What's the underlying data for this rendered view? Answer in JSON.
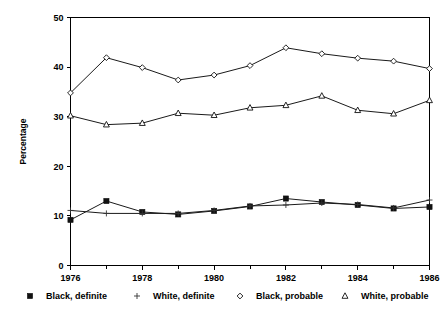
{
  "chart_data": {
    "type": "line",
    "title": "",
    "xlabel": "",
    "ylabel": "Percentage",
    "x": [
      1976,
      1977,
      1978,
      1979,
      1980,
      1981,
      1982,
      1983,
      1984,
      1985,
      1986
    ],
    "xlim": [
      1976,
      1986
    ],
    "ylim": [
      0,
      50
    ],
    "x_tick_labels": [
      "1976",
      "1978",
      "1980",
      "1982",
      "1984",
      "1986"
    ],
    "x_tick_values": [
      1976,
      1978,
      1980,
      1982,
      1984,
      1986
    ],
    "x_minor_tick_values": [
      1977,
      1979,
      1981,
      1983,
      1985
    ],
    "y_tick_labels": [
      "0",
      "10",
      "20",
      "30",
      "40",
      "50"
    ],
    "y_tick_values": [
      0,
      10,
      20,
      30,
      40,
      50
    ],
    "grid": false,
    "legend_position": "bottom",
    "series": [
      {
        "name": "Black, definite",
        "marker": "filled-square",
        "values": [
          9.2,
          13.0,
          10.8,
          10.3,
          11.0,
          11.9,
          13.5,
          12.8,
          12.2,
          11.5,
          11.8
        ]
      },
      {
        "name": "White, definite",
        "marker": "plus",
        "values": [
          11.1,
          10.5,
          10.5,
          10.5,
          11.1,
          12.0,
          12.2,
          12.6,
          12.3,
          11.6,
          13.2
        ]
      },
      {
        "name": "Black, probable",
        "marker": "open-diamond",
        "values": [
          34.8,
          41.9,
          39.9,
          37.4,
          38.4,
          40.3,
          43.9,
          42.7,
          41.8,
          41.2,
          39.7
        ]
      },
      {
        "name": "White, probable",
        "marker": "open-triangle",
        "values": [
          30.2,
          28.4,
          28.7,
          30.7,
          30.3,
          31.8,
          32.3,
          34.2,
          31.3,
          30.6,
          33.3
        ]
      }
    ],
    "colors": {
      "line": "#1a1a1a",
      "axis": "#000000",
      "background": "#ffffff",
      "text": "#000000"
    }
  },
  "legend": {
    "items": [
      {
        "label": "Black, definite",
        "marker": "filled-square"
      },
      {
        "label": "White, definite",
        "marker": "plus"
      },
      {
        "label": "Black, probable",
        "marker": "open-diamond"
      },
      {
        "label": "White, probable",
        "marker": "open-triangle"
      }
    ]
  },
  "axes": {
    "y_title": "Percentage"
  }
}
